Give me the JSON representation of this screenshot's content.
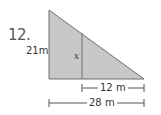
{
  "problem": {
    "number": "12.",
    "labels": {
      "height": "21m",
      "inner_segment": "x",
      "partial_base": "12 m",
      "full_base": "28 m"
    }
  },
  "colors": {
    "fill": "#c8c8c8",
    "stroke": "#707070",
    "text": "#333333"
  }
}
